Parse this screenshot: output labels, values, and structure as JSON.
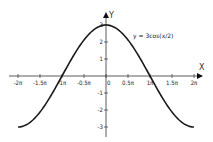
{
  "chart_data": {
    "type": "line",
    "title": "",
    "equation_label": "y = 3cos(x/2)",
    "xlabel": "X",
    "ylabel": "Y",
    "x_tick_labels": [
      "-2π",
      "-1.5π",
      "-1π",
      "-0.5π",
      "0",
      "0.5π",
      "1π",
      "1.5π",
      "2π"
    ],
    "x_tick_values": [
      -6.2832,
      -4.7124,
      -3.1416,
      -1.5708,
      0,
      1.5708,
      3.1416,
      4.7124,
      6.2832
    ],
    "y_tick_labels": [
      "3",
      "2",
      "1",
      "-1",
      "-2",
      "-3"
    ],
    "y_tick_values": [
      3,
      2,
      1,
      -1,
      -2,
      -3
    ],
    "xlim": [
      -6.2832,
      6.2832
    ],
    "ylim": [
      -3,
      3
    ],
    "grid": false,
    "series": [
      {
        "name": "y = 3cos(x/2)",
        "function": "3*cos(x/2)",
        "x": [
          -6.2832,
          -4.7124,
          -3.1416,
          -1.5708,
          0,
          1.5708,
          3.1416,
          4.7124,
          6.2832
        ],
        "values": [
          -3,
          -2.12,
          0,
          2.12,
          3,
          2.12,
          0,
          -2.12,
          -3
        ]
      }
    ]
  },
  "colors": {
    "curve": "#1a1a1a",
    "axis": "#333333",
    "background": "#ffffff"
  }
}
